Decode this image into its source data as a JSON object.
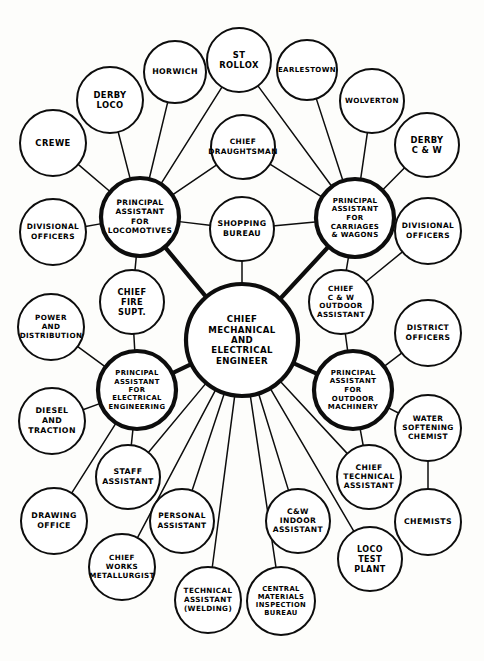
{
  "diagram": {
    "colors": {
      "ink": "#0d0d0d",
      "paper": "#fdfdfb",
      "node_fill": "#ffffff"
    },
    "nodes": [
      {
        "id": "cme",
        "label": "CHIEF\nMECHANICAL\nAND\nELECTRICAL\nENGINEER",
        "cx": 242,
        "cy": 340,
        "r": 56,
        "weight": "major",
        "font": 8.6
      },
      {
        "id": "pa_loco",
        "label": "PRINCIPAL\nASSISTANT\nFOR\nLOCOMOTIVES",
        "cx": 140,
        "cy": 217,
        "r": 39,
        "weight": "major",
        "font": 7.4
      },
      {
        "id": "pa_cw",
        "label": "PRINCIPAL\nASSISTANT\nFOR\nCARRIAGES\n& WAGONS",
        "cx": 355,
        "cy": 218,
        "r": 39,
        "weight": "major",
        "font": 7.0
      },
      {
        "id": "pa_elec",
        "label": "PRINCIPAL\nASSISTANT\nFOR\nELECTRICAL\nENGINEERING",
        "cx": 137,
        "cy": 390,
        "r": 39,
        "weight": "major",
        "font": 6.8
      },
      {
        "id": "pa_outdoor",
        "label": "PRINCIPAL\nASSISTANT\nFOR\nOUTDOOR\nMACHINERY",
        "cx": 353,
        "cy": 390,
        "r": 39,
        "weight": "major",
        "font": 7.0
      },
      {
        "id": "crewe",
        "label": "CREWE",
        "cx": 53,
        "cy": 143,
        "r": 33,
        "weight": "normal",
        "font": 8.4
      },
      {
        "id": "derby_loco",
        "label": "DERBY\nLOCO",
        "cx": 110,
        "cy": 100,
        "r": 33,
        "weight": "normal",
        "font": 8.4
      },
      {
        "id": "horwich",
        "label": "HORWICH",
        "cx": 175,
        "cy": 72,
        "r": 31,
        "weight": "normal",
        "font": 7.8
      },
      {
        "id": "st_rollox",
        "label": "ST\nROLLOX",
        "cx": 239,
        "cy": 60,
        "r": 32,
        "weight": "normal",
        "font": 8.4
      },
      {
        "id": "earlestown",
        "label": "EARLESTOWN",
        "cx": 307,
        "cy": 70,
        "r": 30,
        "weight": "normal",
        "font": 7.0
      },
      {
        "id": "wolverton",
        "label": "WOLVERTON",
        "cx": 372,
        "cy": 101,
        "r": 32,
        "weight": "normal",
        "font": 7.2
      },
      {
        "id": "derby_cw",
        "label": "DERBY\nC & W",
        "cx": 427,
        "cy": 145,
        "r": 32,
        "weight": "normal",
        "font": 8.4
      },
      {
        "id": "chief_draught",
        "label": "CHIEF\nDRAUGHTSMAN",
        "cx": 243,
        "cy": 147,
        "r": 32,
        "weight": "normal",
        "font": 7.4
      },
      {
        "id": "shopping",
        "label": "SHOPPING\nBUREAU",
        "cx": 242,
        "cy": 229,
        "r": 32,
        "weight": "normal",
        "font": 7.8
      },
      {
        "id": "div_off_left",
        "label": "DIVISIONAL\nOFFICERS",
        "cx": 53,
        "cy": 232,
        "r": 33,
        "weight": "normal",
        "font": 7.4
      },
      {
        "id": "chief_fire",
        "label": "CHIEF\nFIRE\nSUPT.",
        "cx": 132,
        "cy": 302,
        "r": 32,
        "weight": "normal",
        "font": 8.2
      },
      {
        "id": "power_dist",
        "label": "POWER\nAND\nDISTRIBUTION",
        "cx": 51,
        "cy": 327,
        "r": 33,
        "weight": "normal",
        "font": 7.2
      },
      {
        "id": "diesel",
        "label": "DIESEL\nAND\nTRACTION",
        "cx": 52,
        "cy": 421,
        "r": 33,
        "weight": "normal",
        "font": 7.8
      },
      {
        "id": "drawing",
        "label": "DRAWING\nOFFICE",
        "cx": 54,
        "cy": 521,
        "r": 33,
        "weight": "normal",
        "font": 7.8
      },
      {
        "id": "staff_asst",
        "label": "STAFF\nASSISTANT",
        "cx": 128,
        "cy": 477,
        "r": 32,
        "weight": "normal",
        "font": 7.8
      },
      {
        "id": "chief_works",
        "label": "CHIEF\nWORKS\nMETALLURGIST",
        "cx": 122,
        "cy": 567,
        "r": 33,
        "weight": "normal",
        "font": 7.2
      },
      {
        "id": "personal_asst",
        "label": "PERSONAL\nASSISTANT",
        "cx": 182,
        "cy": 521,
        "r": 32,
        "weight": "normal",
        "font": 7.4
      },
      {
        "id": "tech_weld",
        "label": "TECHNICAL\nASSISTANT\n(WELDING)",
        "cx": 208,
        "cy": 600,
        "r": 33,
        "weight": "normal",
        "font": 7.2
      },
      {
        "id": "central_mat",
        "label": "CENTRAL\nMATERIALS\nINSPECTION\nBUREAU",
        "cx": 281,
        "cy": 601,
        "r": 34,
        "weight": "normal",
        "font": 6.8
      },
      {
        "id": "cw_indoor",
        "label": "C&W\nINDOOR\nASSISTANT",
        "cx": 298,
        "cy": 521,
        "r": 32,
        "weight": "normal",
        "font": 7.6
      },
      {
        "id": "loco_test",
        "label": "LOCO\nTEST\nPLANT",
        "cx": 370,
        "cy": 559,
        "r": 32,
        "weight": "normal",
        "font": 8.0
      },
      {
        "id": "chief_tech",
        "label": "CHIEF\nTECHNICAL\nASSISTANT",
        "cx": 369,
        "cy": 477,
        "r": 32,
        "weight": "normal",
        "font": 7.6
      },
      {
        "id": "chief_cw_out",
        "label": "CHIEF\nC & W\nOUTDOOR\nASSISTANT",
        "cx": 341,
        "cy": 302,
        "r": 32,
        "weight": "normal",
        "font": 7.2
      },
      {
        "id": "div_off_right",
        "label": "DIVISIONAL\nOFFICERS",
        "cx": 428,
        "cy": 231,
        "r": 33,
        "weight": "normal",
        "font": 7.4
      },
      {
        "id": "district_off",
        "label": "DISTRICT\nOFFICERS",
        "cx": 428,
        "cy": 333,
        "r": 33,
        "weight": "normal",
        "font": 7.6
      },
      {
        "id": "water_chem",
        "label": "WATER\nSOFTENING\nCHEMIST",
        "cx": 428,
        "cy": 428,
        "r": 33,
        "weight": "normal",
        "font": 7.4
      },
      {
        "id": "chemists",
        "label": "CHEMISTS",
        "cx": 428,
        "cy": 522,
        "r": 33,
        "weight": "normal",
        "font": 7.8
      }
    ],
    "edges": [
      {
        "from": "cme",
        "to": "pa_loco",
        "weight": "thick"
      },
      {
        "from": "cme",
        "to": "pa_cw",
        "weight": "thick"
      },
      {
        "from": "cme",
        "to": "pa_elec",
        "weight": "thick"
      },
      {
        "from": "cme",
        "to": "pa_outdoor",
        "weight": "thick"
      },
      {
        "from": "cme",
        "to": "shopping",
        "weight": "thin"
      },
      {
        "from": "cme",
        "to": "staff_asst",
        "weight": "thin"
      },
      {
        "from": "cme",
        "to": "chief_works",
        "weight": "thin"
      },
      {
        "from": "cme",
        "to": "personal_asst",
        "weight": "thin"
      },
      {
        "from": "cme",
        "to": "tech_weld",
        "weight": "thin"
      },
      {
        "from": "cme",
        "to": "central_mat",
        "weight": "thin"
      },
      {
        "from": "cme",
        "to": "cw_indoor",
        "weight": "thin"
      },
      {
        "from": "cme",
        "to": "loco_test",
        "weight": "thin"
      },
      {
        "from": "cme",
        "to": "chief_tech",
        "weight": "thin"
      },
      {
        "from": "pa_loco",
        "to": "crewe",
        "weight": "thin"
      },
      {
        "from": "pa_loco",
        "to": "derby_loco",
        "weight": "thin"
      },
      {
        "from": "pa_loco",
        "to": "horwich",
        "weight": "thin"
      },
      {
        "from": "pa_loco",
        "to": "st_rollox",
        "weight": "thin"
      },
      {
        "from": "pa_loco",
        "to": "chief_draught",
        "weight": "thin"
      },
      {
        "from": "pa_loco",
        "to": "shopping",
        "weight": "thin"
      },
      {
        "from": "pa_loco",
        "to": "div_off_left",
        "weight": "thin"
      },
      {
        "from": "pa_loco",
        "to": "chief_fire",
        "weight": "thin"
      },
      {
        "from": "pa_cw",
        "to": "st_rollox",
        "weight": "thin"
      },
      {
        "from": "pa_cw",
        "to": "earlestown",
        "weight": "thin"
      },
      {
        "from": "pa_cw",
        "to": "wolverton",
        "weight": "thin"
      },
      {
        "from": "pa_cw",
        "to": "derby_cw",
        "weight": "thin"
      },
      {
        "from": "pa_cw",
        "to": "chief_draught",
        "weight": "thin"
      },
      {
        "from": "pa_cw",
        "to": "shopping",
        "weight": "thin"
      },
      {
        "from": "pa_cw",
        "to": "div_off_right",
        "weight": "thin"
      },
      {
        "from": "pa_cw",
        "to": "chief_cw_out",
        "weight": "thin"
      },
      {
        "from": "pa_elec",
        "to": "power_dist",
        "weight": "thin"
      },
      {
        "from": "pa_elec",
        "to": "chief_fire",
        "weight": "thin"
      },
      {
        "from": "pa_elec",
        "to": "diesel",
        "weight": "thin"
      },
      {
        "from": "pa_elec",
        "to": "drawing",
        "weight": "thin"
      },
      {
        "from": "pa_elec",
        "to": "staff_asst",
        "weight": "thin"
      },
      {
        "from": "pa_outdoor",
        "to": "district_off",
        "weight": "thin"
      },
      {
        "from": "pa_outdoor",
        "to": "water_chem",
        "weight": "thin"
      },
      {
        "from": "pa_outdoor",
        "to": "chief_tech",
        "weight": "thin"
      },
      {
        "from": "pa_outdoor",
        "to": "chief_cw_out",
        "weight": "thin"
      },
      {
        "from": "div_off_right",
        "to": "chief_cw_out",
        "weight": "thin"
      },
      {
        "from": "water_chem",
        "to": "chemists",
        "weight": "thin"
      }
    ]
  }
}
